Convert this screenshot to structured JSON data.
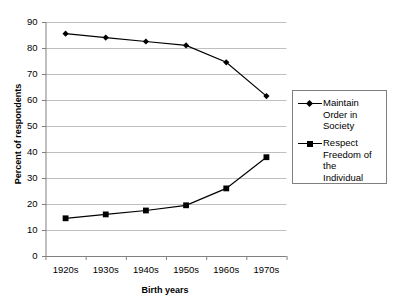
{
  "chart_data": {
    "type": "line",
    "title": "",
    "subtitle": "",
    "xlabel": "Birth years",
    "ylabel": "Percent of respondents",
    "categories": [
      "1920s",
      "1930s",
      "1940s",
      "1950s",
      "1960s",
      "1970s"
    ],
    "ylim": [
      0,
      90
    ],
    "yticks": [
      0,
      10,
      20,
      30,
      40,
      50,
      60,
      70,
      80,
      90
    ],
    "ytick_labels": [
      "0",
      "10",
      "20",
      "30",
      "40",
      "50",
      "60",
      "70",
      "80",
      "90"
    ],
    "grid": "horizontal",
    "legend_position": "right",
    "series": [
      {
        "name": "Maintain Order in Society",
        "marker": "diamond",
        "color": "#000000",
        "values": [
          85.5,
          84.0,
          82.5,
          81.0,
          74.5,
          61.5
        ]
      },
      {
        "name": "Respect Freedom of the Individual",
        "marker": "square",
        "color": "#000000",
        "values": [
          14.5,
          16.0,
          17.5,
          19.5,
          26.0,
          38.0
        ]
      }
    ]
  },
  "legend": {
    "entries": [
      {
        "label": "Maintain\nOrder in\nSociety",
        "marker": "diamond-marker"
      },
      {
        "label": "Respect\nFreedom of\nthe\nIndividual",
        "marker": "square-marker"
      }
    ]
  },
  "axes": {
    "y_title": "Percent of respondents",
    "x_title": "Birth years"
  },
  "colors": {
    "line": "#000000",
    "gridline": "#bfbfbf",
    "axis": "#808080",
    "legend_border": "#7f7f7f",
    "background": "#ffffff"
  }
}
